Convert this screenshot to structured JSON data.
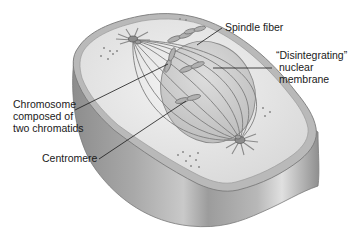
{
  "diagram": {
    "colors": {
      "background": "#ffffff",
      "cell_side": "#9a9a9a",
      "cell_top": "#e6e6e6",
      "cell_rim": "#b5b5b5",
      "nucleus": "#c9c9c9",
      "spindle": "#7f7f7f",
      "label_text": "#1a1a1a",
      "leader_line": "#1a1a1a"
    },
    "labels": {
      "spindle_fiber": "Spindle fiber",
      "nuclear_membrane": {
        "line1": "“Disintegrating”",
        "line2": "nuclear",
        "line3": "membrane"
      },
      "chromosome": {
        "line1": "Chromosome",
        "line2": "composed of",
        "line3": "two chromatids"
      },
      "centromere": "Centromere"
    },
    "structures": [
      "cell-membrane",
      "cytoplasm",
      "centrosome-top",
      "centrosome-bottom",
      "spindle-fibers",
      "nuclear-membrane",
      "chromosomes",
      "cytoplasmic-granules"
    ]
  }
}
